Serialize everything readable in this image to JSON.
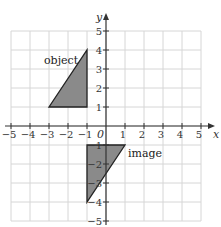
{
  "diagram": {
    "type": "coordinate-grid-transformation",
    "axes": {
      "x_label": "x",
      "y_label": "y",
      "origin_label": "0",
      "x_range": [
        -5,
        5
      ],
      "y_range": [
        -5,
        5
      ],
      "x_ticks": [
        "-5",
        "-4",
        "-3",
        "-2",
        "-1",
        "1",
        "2",
        "3",
        "4",
        "5"
      ],
      "y_ticks": [
        "5",
        "4",
        "3",
        "2",
        "1",
        "-1",
        "-2",
        "-3",
        "-4",
        "-5"
      ]
    },
    "shapes": [
      {
        "label": "object",
        "vertices": [
          [
            -3,
            1
          ],
          [
            -1,
            1
          ],
          [
            -1,
            4
          ]
        ],
        "fill": "#8a8a8a"
      },
      {
        "label": "image",
        "vertices": [
          [
            -1,
            -1
          ],
          [
            1,
            -1
          ],
          [
            -1,
            -4
          ]
        ],
        "fill": "#8a8a8a"
      }
    ],
    "colors": {
      "grid": "#d6d6d6",
      "axis": "#333333",
      "shape_fill": "#8a8a8a",
      "shape_stroke": "#222222"
    }
  }
}
